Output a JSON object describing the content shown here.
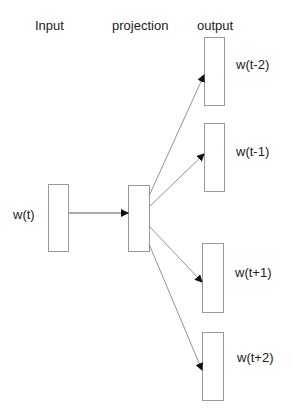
{
  "headers": {
    "input": "Input",
    "projection": "projection",
    "output": "output"
  },
  "input_word": "w(t)",
  "outputs": [
    {
      "label": "w(t-2)"
    },
    {
      "label": "w(t-1)"
    },
    {
      "label": "w(t+1)"
    },
    {
      "label": "w(t+2)"
    }
  ],
  "colors": {
    "box_border": "#9a9a9a",
    "arrow": "#555555",
    "text": "#222222"
  }
}
